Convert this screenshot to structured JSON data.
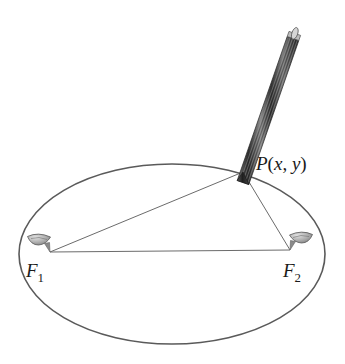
{
  "figure": {
    "background_color": "#ffffff",
    "width": 345,
    "height": 364
  },
  "ellipse": {
    "name": "ellipse-curve",
    "center_x": 172,
    "center_y": 254,
    "radius_x": 153,
    "radius_y": 90,
    "stroke_color": "#5a5a5a",
    "stroke_width": 1.6,
    "fill": "none"
  },
  "points": {
    "P": {
      "label": "P(x, y)",
      "label_p": "P",
      "label_open": "(",
      "label_x": "x",
      "label_comma": ", ",
      "label_y": "y",
      "label_close": ")",
      "x": 243,
      "y": 172,
      "label_x_pos": 256,
      "label_y_pos": 170
    },
    "F1": {
      "label_letter": "F",
      "label_subscript": "1",
      "x": 50,
      "y": 252,
      "label_x_pos": 26,
      "label_y_pos": 277
    },
    "F2": {
      "label_letter": "F",
      "label_subscript": "2",
      "x": 290,
      "y": 250,
      "label_x_pos": 283,
      "label_y_pos": 277
    }
  },
  "string_segments": [
    {
      "name": "segment-f1-to-p",
      "from": "F1",
      "to": "P",
      "x1": 50,
      "y1": 252,
      "x2": 243,
      "y2": 172
    },
    {
      "name": "segment-p-to-f2",
      "from": "P",
      "to": "F2",
      "x1": 243,
      "y1": 172,
      "x2": 290,
      "y2": 250
    },
    {
      "name": "segment-f1-to-f2",
      "from": "F1",
      "to": "F2",
      "x1": 50,
      "y1": 252,
      "x2": 290,
      "y2": 250
    }
  ],
  "line_style": {
    "stroke_color": "#6b6b6b",
    "stroke_width": 1.0
  },
  "thumbtacks": [
    {
      "name": "thumbtack-f1",
      "head_x": 40,
      "head_y": 240,
      "tip_x": 50,
      "tip_y": 252,
      "mirrored": false
    },
    {
      "name": "thumbtack-f2",
      "head_x": 300,
      "head_y": 240,
      "tip_x": 290,
      "tip_y": 250,
      "mirrored": true
    }
  ],
  "thumbtack_style": {
    "head_fill": "#b8b8b8",
    "head_stroke": "#555555",
    "shaft_fill": "#8a8a8a"
  },
  "pencil": {
    "name": "pencil",
    "tip_x": 243,
    "tip_y": 172,
    "top_x": 293,
    "top_y": 33,
    "half_width": 6,
    "body_fill": "#3a3a3a",
    "stripe_color": "#9a9a9a",
    "tip_fill": "#2b2b2b",
    "cap_fill": "#cfcfcf",
    "cap_stroke": "#4a4a4a",
    "stripe_count": 5
  }
}
